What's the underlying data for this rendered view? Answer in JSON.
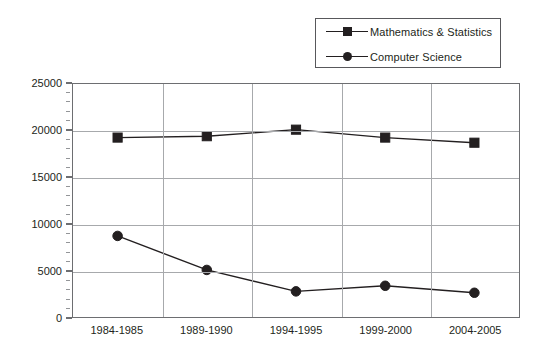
{
  "chart_data": {
    "type": "line",
    "title": "",
    "subtitle": "",
    "xlabel": "",
    "ylabel": "",
    "categories": [
      "1984-1985",
      "1989-1990",
      "1994-1995",
      "1999-2000",
      "2004-2005"
    ],
    "series": [
      {
        "name": "Mathematics & Statistics",
        "marker": "square",
        "color": "#231f20",
        "values": [
          19250,
          19400,
          20100,
          19250,
          18700
        ]
      },
      {
        "name": "Computer Science",
        "marker": "circle",
        "color": "#231f20",
        "values": [
          8700,
          5050,
          2750,
          3350,
          2600
        ]
      }
    ],
    "ylim": [
      0,
      25000
    ],
    "yticks": [
      0,
      5000,
      10000,
      15000,
      20000,
      25000
    ],
    "ytick_labels": [
      "0",
      "5000",
      "10000",
      "15000",
      "20000",
      "25000"
    ],
    "ytick_minor_step": 1000,
    "grid": {
      "horizontal": true,
      "vertical": true
    },
    "legend": {
      "position": "top-right",
      "border": true
    }
  },
  "legend": {
    "entries": [
      {
        "label": "Mathematics & Statistics",
        "marker": "square"
      },
      {
        "label": "Computer Science",
        "marker": "circle"
      }
    ]
  },
  "colors": {
    "line": "#231f20",
    "marker": "#231f20",
    "grid": "#a7a9ac",
    "axis": "#6d6e71",
    "background": "#ffffff",
    "text": "#231f20"
  }
}
